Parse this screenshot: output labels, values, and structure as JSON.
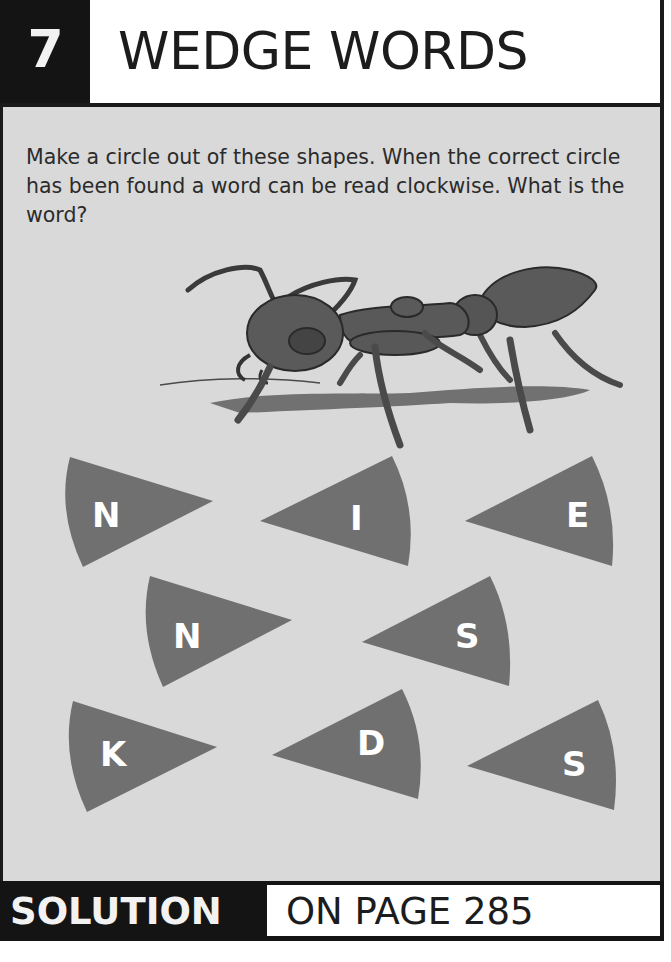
{
  "header": {
    "puzzle_number": "7",
    "title": "WEDGE WORDS"
  },
  "instructions": "Make a circle out of these shapes. When the correct circle has been found a word can be read clockwise. What is the word?",
  "illustration": {
    "subject": "ant-illustration"
  },
  "wedges": [
    {
      "letter": "N",
      "row": 1,
      "col": 1,
      "point_direction": "right"
    },
    {
      "letter": "I",
      "row": 1,
      "col": 2,
      "point_direction": "left"
    },
    {
      "letter": "E",
      "row": 1,
      "col": 3,
      "point_direction": "left"
    },
    {
      "letter": "N",
      "row": 2,
      "col": 1,
      "point_direction": "right"
    },
    {
      "letter": "S",
      "row": 2,
      "col": 2,
      "point_direction": "left"
    },
    {
      "letter": "K",
      "row": 3,
      "col": 1,
      "point_direction": "right"
    },
    {
      "letter": "D",
      "row": 3,
      "col": 2,
      "point_direction": "left"
    },
    {
      "letter": "S",
      "row": 3,
      "col": 3,
      "point_direction": "left"
    }
  ],
  "footer": {
    "label": "SOLUTION",
    "page_ref": "ON PAGE 285"
  },
  "colors": {
    "dark": "#141414",
    "panel": "#d9d9d9",
    "wedge": "#707070",
    "text": "#2b2b2b"
  }
}
